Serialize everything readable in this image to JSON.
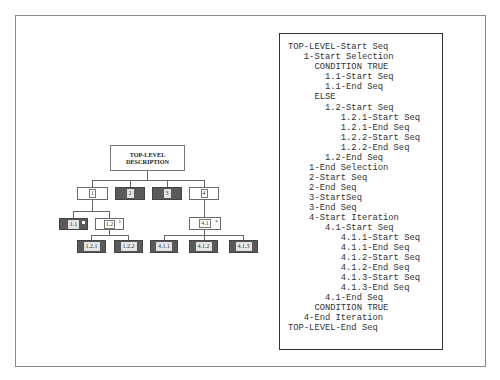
{
  "tree": {
    "root": {
      "line1": "TOP-LEVEL",
      "line2": "DESCRIPTION"
    },
    "level1": [
      {
        "id": "1",
        "style": "white"
      },
      {
        "id": "2",
        "style": "dark"
      },
      {
        "id": "3",
        "style": "dark"
      },
      {
        "id": "4",
        "style": "white"
      }
    ],
    "level2": [
      {
        "id": "1.1",
        "style": "dark",
        "marker": "■"
      },
      {
        "id": "1.2",
        "style": "white",
        "marker": "°"
      },
      {
        "id": "4.1",
        "style": "white",
        "marker": "*"
      }
    ],
    "level3": [
      {
        "id": "1.2.1",
        "style": "dark"
      },
      {
        "id": "1.2.2",
        "style": "dark"
      },
      {
        "id": "4.1.1",
        "style": "dark"
      },
      {
        "id": "4.1.2",
        "style": "dark"
      },
      {
        "id": "4.1.3",
        "style": "dark"
      }
    ]
  },
  "pseudocode": {
    "lines": [
      "TOP-LEVEL-Start Seq",
      "   1-Start Selection",
      "     CONDITION TRUE",
      "       1.1-Start Seq",
      "       1.1-End Seq",
      "     ELSE",
      "       1.2-Start Seq",
      "          1.2.1-Start Seq",
      "          1.2.1-End Seq",
      "          1.2.2-Start Seq",
      "          1.2.2-End Seq",
      "       1.2-End Seq",
      "    1-End Selection",
      "    2-Start Seq",
      "    2-End Seq",
      "    3-StartSeq",
      "    3-End Seq",
      "    4-Start Iteration",
      "       4.1-Start Seq",
      "          4.1.1-Start Seq",
      "          4.1.1-End Seq",
      "          4.1.2-Start Seq",
      "          4.1.2-End Seq",
      "          4.1.3-Start Seq",
      "          4.1.3-End Seq",
      "       4.1-End Seq",
      "     CONDITION TRUE",
      "   4-End Iteration",
      "TOP-LEVEL-End Seq"
    ]
  },
  "colors": {
    "dark_node": "#5a5a5a",
    "line": "#666666",
    "frame": "#8a8a8a",
    "code_border": "#333333"
  }
}
